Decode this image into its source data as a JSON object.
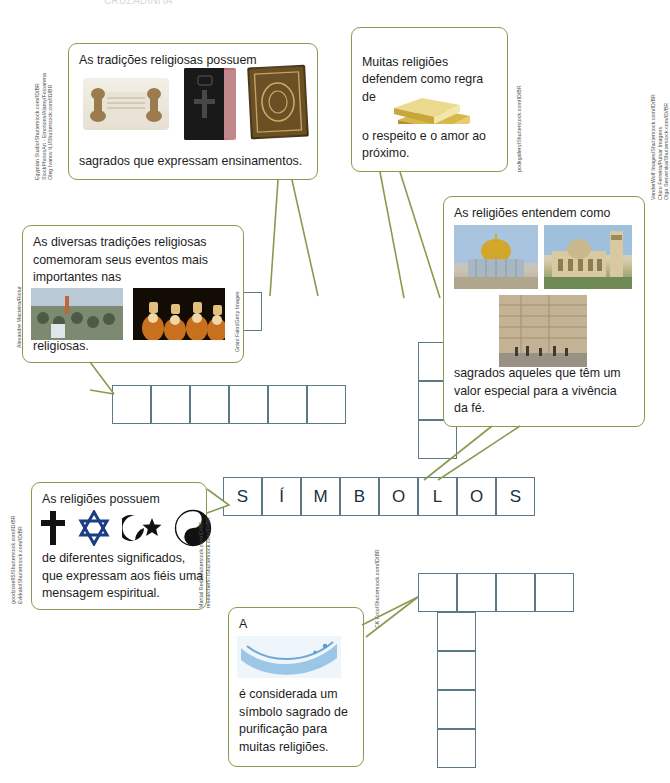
{
  "page": {
    "title_fragment": "CRUZADINHA",
    "grid_line_color": "#5b7a85",
    "bubble_border_color": "#8a9a4e"
  },
  "crossword": {
    "answer_across": "SÍMBOLOS",
    "letters": [
      "S",
      "Í",
      "M",
      "B",
      "O",
      "L",
      "O",
      "S"
    ],
    "cell_size": 39,
    "rows": [
      {
        "name": "row-top-col-a",
        "cells": 1,
        "x": 223,
        "y": 292,
        "dir": "v"
      },
      {
        "name": "row-mid-horizontal",
        "cells": 6,
        "x": 112,
        "y": 385,
        "dir": "h"
      },
      {
        "name": "row-right-col-b",
        "cells": 3,
        "x": 418,
        "y": 342,
        "dir": "v"
      },
      {
        "name": "row-answer",
        "cells": 8,
        "x": 223,
        "y": 477,
        "dir": "h"
      },
      {
        "name": "row-lower-horizontal",
        "cells": 4,
        "x": 418,
        "y": 573,
        "dir": "h"
      },
      {
        "name": "row-lower-col",
        "cells": 4,
        "x": 437,
        "y": 612,
        "dir": "v"
      }
    ]
  },
  "bubbles": {
    "books": {
      "name": "bubble-sacred-books",
      "text_top": "As tradições religiosas possuem",
      "text_bottom": "sagrados que expressam ensinamentos.",
      "credits": [
        "Egyptian Studio/Shutterstock.com/ID/BR",
        "StockPhotosArt - Emotions/Alamy/Fotoarena",
        "Oleg Ivanov ILI/Shutterstock.com/ID/BR"
      ],
      "images": [
        "torah-scroll",
        "bible-book",
        "quran-book"
      ]
    },
    "gold": {
      "name": "bubble-golden-rule",
      "text_top": "Muitas religiões\ndefendem como regra de",
      "text_bottom": "o respeito e o amor ao\npróximo.",
      "credits": [
        "podkgallery/Shutterstock.com/ID/BR"
      ],
      "images": [
        "gold-bars"
      ]
    },
    "festivals": {
      "name": "bubble-festivals",
      "text_top": "As diversas tradições religiosas\ncomemoram seus eventos mais\nimportantes nas",
      "text_bottom": "religiosas.",
      "credits": [
        "Alexandre Macieira/Riotur",
        "Grant Faint/Getty Images"
      ],
      "images": [
        "procession-photo",
        "festival-photo"
      ]
    },
    "places": {
      "name": "bubble-sacred-places",
      "text_top": "As religiões entendem como",
      "text_bottom": "sagrados aqueles que têm um\nvalor especial para a vivência\nda fé.",
      "credits": [
        "VanderWolf Images/Shutterstock.com/ID/BR",
        "Chico Ferreira/Pulsar Imagens",
        "Olga Senvetska/Shutterstock.com/ID/BR"
      ],
      "images": [
        "dome-of-the-rock",
        "basilica",
        "western-wall"
      ]
    },
    "symbols": {
      "name": "bubble-symbols",
      "text_top": "As religiões possuem",
      "text_bottom": "de diferentes significados,\nque expressam aos fiéis uma\nmensagem espiritual.",
      "credits": [
        "goodzone95/Shutterstock.com/ID/BR",
        "Evkkalo/Shutterstock.com/ID/BR",
        "Martial Red/Shutterstock.com/ID/BR",
        "researcher97/Shutterstock.com/ID/BR"
      ],
      "icons": [
        "christian-cross",
        "star-of-david",
        "star-and-crescent",
        "yin-yang"
      ]
    },
    "water": {
      "name": "bubble-water",
      "text_top": "A",
      "text_bottom": "é considerada um\nsímbolo sagrado de\npurificação para\nmuitas religiões.",
      "credits": [
        "CK Foto/Shutterstock.com/ID/BR"
      ],
      "images": [
        "water-splash"
      ]
    }
  }
}
